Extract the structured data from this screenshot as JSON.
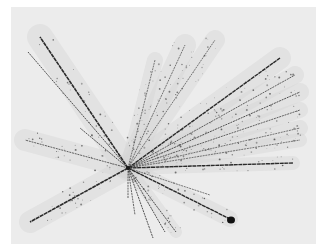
{
  "image": {
    "description": "Grayscale photograph of a nuclear emulsion star: many particle tracks radiating from a single interaction point",
    "background_color": "#ffffff",
    "panel_color": "#ececec",
    "panel": {
      "x": 11,
      "y": 7,
      "width": 305,
      "height": 237
    },
    "vertex": {
      "x": 128,
      "y": 168
    },
    "track_color": "#2a2a2a",
    "halo_color": "#d6d6d6",
    "blob": {
      "x": 231,
      "y": 220,
      "rx": 4,
      "ry": 3.5
    }
  },
  "tracks": [
    {
      "x": 40,
      "y": 37,
      "w": 1.6,
      "halo": 26
    },
    {
      "x": 28,
      "y": 52,
      "w": 0.8,
      "halo": 0
    },
    {
      "x": 30,
      "y": 222,
      "w": 1.6,
      "halo": 22
    },
    {
      "x": 25,
      "y": 140,
      "w": 0.7,
      "halo": 22
    },
    {
      "x": 80,
      "y": 128,
      "w": 0.8,
      "halo": 0
    },
    {
      "x": 155,
      "y": 60,
      "w": 0.6,
      "halo": 16
    },
    {
      "x": 185,
      "y": 45,
      "w": 0.6,
      "halo": 22
    },
    {
      "x": 215,
      "y": 40,
      "w": 0.6,
      "halo": 20
    },
    {
      "x": 280,
      "y": 58,
      "w": 1.4,
      "halo": 22
    },
    {
      "x": 295,
      "y": 75,
      "w": 0.7,
      "halo": 18
    },
    {
      "x": 300,
      "y": 92,
      "w": 0.8,
      "halo": 18
    },
    {
      "x": 300,
      "y": 110,
      "w": 0.7,
      "halo": 16
    },
    {
      "x": 300,
      "y": 128,
      "w": 0.6,
      "halo": 16
    },
    {
      "x": 300,
      "y": 140,
      "w": 0.6,
      "halo": 14
    },
    {
      "x": 293,
      "y": 163,
      "w": 1.4,
      "halo": 14
    },
    {
      "x": 230,
      "y": 219,
      "w": 1.4,
      "halo": 16
    },
    {
      "x": 176,
      "y": 232,
      "w": 0.8,
      "halo": 12
    },
    {
      "x": 165,
      "y": 232,
      "w": 0.8,
      "halo": 0
    },
    {
      "x": 153,
      "y": 238,
      "w": 0.8,
      "halo": 0
    },
    {
      "x": 135,
      "y": 215,
      "w": 0.7,
      "halo": 0
    },
    {
      "x": 128,
      "y": 198,
      "w": 0.7,
      "halo": 0
    },
    {
      "x": 210,
      "y": 195,
      "w": 0.6,
      "halo": 0
    }
  ]
}
